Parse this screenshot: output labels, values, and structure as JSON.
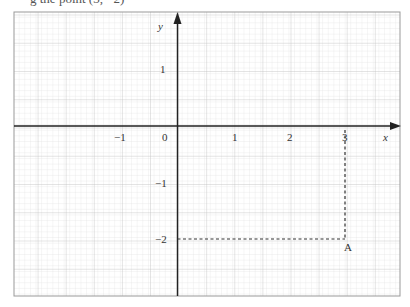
{
  "header": {
    "cut_text": "g            the point (3, −2) "
  },
  "axes": {
    "x_label": "x",
    "y_label": "y",
    "x_ticks": [
      "−1",
      "0",
      "1",
      "2",
      "3"
    ],
    "y_ticks": [
      "1",
      "−1",
      "−2"
    ]
  },
  "point": {
    "label": "A",
    "x": 3,
    "y": -2
  },
  "colors": {
    "grid_minor": "#dcdcdc",
    "grid_major": "#b8b8b8",
    "axis": "#222222"
  }
}
